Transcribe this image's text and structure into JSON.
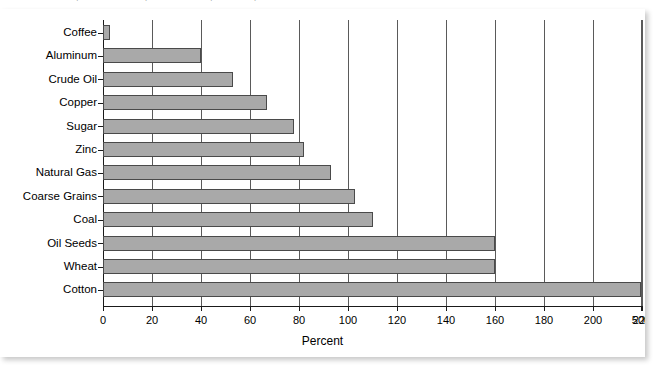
{
  "caption": {
    "text": "of which production located in particular countries, per cent of exports"
  },
  "chart_data": {
    "type": "bar",
    "orientation": "horizontal",
    "title": "",
    "xlabel": "Percent",
    "ylabel": "",
    "categories": [
      "Coffee",
      "Aluminum",
      "Crude Oil",
      "Copper",
      "Sugar",
      "Zinc",
      "Natural Gas",
      "Coarse Grains",
      "Coal",
      "Oil Seeds",
      "Wheat",
      "Cotton"
    ],
    "values": [
      3,
      40,
      53,
      67,
      78,
      82,
      93,
      103,
      110,
      160,
      160,
      500
    ],
    "xtick_labels": [
      "0",
      "20",
      "40",
      "60",
      "80",
      "100",
      "120",
      "140",
      "160",
      "180",
      "200",
      "220",
      "240",
      "260",
      "500"
    ],
    "xtick_values": [
      0,
      20,
      40,
      60,
      80,
      100,
      120,
      140,
      160,
      180,
      200,
      220,
      240,
      260,
      500
    ],
    "xlim": [
      0,
      280
    ],
    "axis_break": {
      "present": true,
      "after": 260,
      "resumes_at": 500
    },
    "grid": "vertical",
    "legend": "none",
    "bar_color": "#a9a9a9",
    "bar_edge_color": "#4a4a4a",
    "gridline_color": "#5a5a5a",
    "axis_color": "#1a1a1a"
  }
}
